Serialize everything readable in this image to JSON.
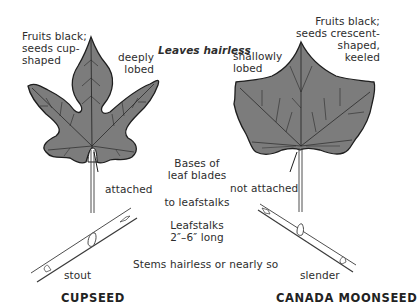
{
  "header": {
    "title": "Leaves hairless"
  },
  "left_species": {
    "name": "CUPSEED",
    "fruit_note": "Fruits black;\nseeds cup-\nshaped",
    "lobe_note": "deeply\nlobed",
    "attachment_note": "attached",
    "stem_note": "stout"
  },
  "right_species": {
    "name": "CANADA MOONSEED",
    "fruit_note": "Fruits black;\nseeds crescent-\nshaped,\nkeeled",
    "lobe_note": "shallowly\nlobed",
    "attachment_note": "not attached",
    "stem_note": "slender"
  },
  "center_notes": {
    "bases_of_leaf_blades": "Bases of\nleaf blades",
    "to_leafstalks": "to leafstalks",
    "leafstalk_length": "Leafstalks\n2″–6″ long",
    "stems": "Stems hairless or nearly so"
  },
  "colors": {
    "leaf_fill": "#7c7c7c",
    "leaf_outline": "#1e1e1e",
    "vein": "#2a2a2a",
    "text": "#2d2d2d",
    "background": "#ffffff"
  }
}
